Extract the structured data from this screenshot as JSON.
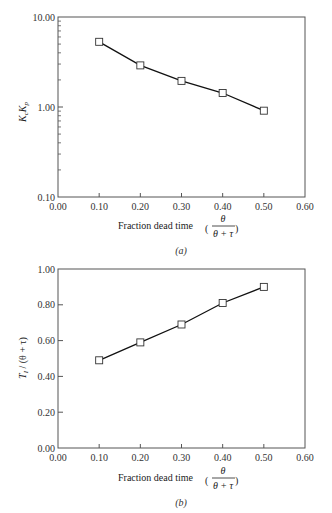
{
  "chart_data": [
    {
      "type": "line",
      "panel": "(a)",
      "title": "",
      "xlabel": "Fraction dead time (θ/(θ+τ))",
      "ylabel": "KcKp",
      "yscale": "log",
      "xlim": [
        0.0,
        0.6
      ],
      "ylim": [
        0.1,
        10.0
      ],
      "x_ticks": [
        "0.00",
        "0.10",
        "0.20",
        "0.30",
        "0.40",
        "0.50",
        "0.60"
      ],
      "y_ticks": [
        "0.10",
        "1.00",
        "10.00"
      ],
      "x": [
        0.1,
        0.2,
        0.3,
        0.4,
        0.5
      ],
      "series": [
        {
          "name": "KcKp",
          "marker": "square",
          "values": [
            5.3,
            2.9,
            1.95,
            1.43,
            0.91
          ]
        }
      ],
      "grid": false,
      "legend": null
    },
    {
      "type": "line",
      "panel": "(b)",
      "title": "",
      "xlabel": "Fraction dead time (θ/(θ+τ))",
      "ylabel": "TI / (θ + τ)",
      "yscale": "linear",
      "xlim": [
        0.0,
        0.6
      ],
      "ylim": [
        0.0,
        1.0
      ],
      "x_ticks": [
        "0.00",
        "0.10",
        "0.20",
        "0.30",
        "0.40",
        "0.50",
        "0.60"
      ],
      "y_ticks": [
        "0.00",
        "0.20",
        "0.40",
        "0.60",
        "0.80",
        "1.00"
      ],
      "x": [
        0.1,
        0.2,
        0.3,
        0.4,
        0.5
      ],
      "series": [
        {
          "name": "TI/(θ+τ)",
          "marker": "square",
          "values": [
            0.49,
            0.59,
            0.69,
            0.81,
            0.9
          ]
        }
      ],
      "grid": false,
      "legend": null
    }
  ],
  "labels": {
    "a": {
      "ylabel_main": "K",
      "ylabel_sub1": "c",
      "ylabel_mid": "K",
      "ylabel_sub2": "p",
      "xlabel_text": "Fraction dead time",
      "frac_num": "θ",
      "frac_den": "θ + τ",
      "caption": "(a)",
      "x_ticks": [
        "0.00",
        "0.10",
        "0.20",
        "0.30",
        "0.40",
        "0.50",
        "0.60"
      ],
      "y_ticks": [
        "0.10",
        "1.00",
        "10.00"
      ]
    },
    "b": {
      "ylabel_main": "T",
      "ylabel_sub": "I",
      "ylabel_rest": " / (θ + τ)",
      "xlabel_text": "Fraction dead time",
      "frac_num": "θ",
      "frac_den": "θ + τ",
      "caption": "(b)",
      "x_ticks": [
        "0.00",
        "0.10",
        "0.20",
        "0.30",
        "0.40",
        "0.50",
        "0.60"
      ],
      "y_ticks": [
        "0.00",
        "0.20",
        "0.40",
        "0.60",
        "0.80",
        "1.00"
      ]
    }
  },
  "colors": {
    "line": "#111111",
    "axis": "#444444",
    "marker_fill": "#ffffff"
  }
}
